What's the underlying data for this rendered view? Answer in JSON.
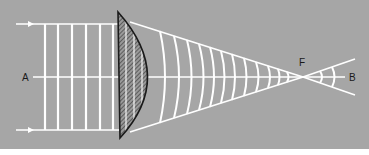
{
  "diagram": {
    "labels": {
      "a": "A",
      "b": "B",
      "f": "F"
    },
    "colors": {
      "background": "#a6a6a6",
      "lines": "#ffffff",
      "lens_outline": "#1a1a1a",
      "lens_fill": "#8a8a8a",
      "text": "#1a1a1a"
    },
    "elements": {
      "incident_rays": [
        "top-ray",
        "bottom-ray"
      ],
      "plane_wavefronts_count": 6,
      "lens": "plano-convex lens (hatched)",
      "converging_wavefronts_count": 12,
      "diverging_wavefronts_count": 2,
      "optical_axis": "A to B",
      "focal_point": "F"
    }
  }
}
